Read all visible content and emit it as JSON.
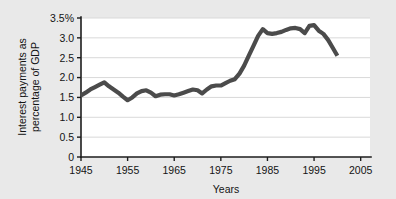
{
  "chart_data": {
    "type": "line",
    "title": "",
    "xlabel": "Years",
    "ylabel": "Interest payments as percentage of GDP",
    "ylabel_line1": "Interest payments as",
    "ylabel_line2": "percentage of GDP",
    "xlim": [
      1945,
      2007
    ],
    "ylim": [
      0,
      3.5
    ],
    "grid": true,
    "legend": "none",
    "line_color": "#4b4b4b",
    "background_color": "#e9e9e9",
    "plot_background_color": "#ffffff",
    "gridline_color": "#d9d9d9",
    "axis_color": "#1d1d1d",
    "ytick_labels": [
      "3.5%",
      "3.0",
      "2.5",
      "2.0",
      "1.5",
      "1.0",
      "0.5",
      "0"
    ],
    "ytick_values": [
      3.5,
      3.0,
      2.5,
      2.0,
      1.5,
      1.0,
      0.5,
      0
    ],
    "xtick_labels": [
      "1945",
      "1955",
      "1965",
      "1975",
      "1985",
      "1995",
      "2005"
    ],
    "xtick_values": [
      1945,
      1955,
      1965,
      1975,
      1985,
      1995,
      2005
    ],
    "x": [
      1945,
      1946,
      1947,
      1948,
      1949,
      1950,
      1951,
      1952,
      1953,
      1954,
      1955,
      1956,
      1957,
      1958,
      1959,
      1960,
      1961,
      1962,
      1963,
      1964,
      1965,
      1966,
      1967,
      1968,
      1969,
      1970,
      1971,
      1972,
      1973,
      1974,
      1975,
      1976,
      1977,
      1978,
      1979,
      1980,
      1981,
      1982,
      1983,
      1984,
      1985,
      1986,
      1987,
      1988,
      1989,
      1990,
      1991,
      1992,
      1993,
      1994,
      1995,
      1996,
      1997,
      1998,
      1999,
      2000
    ],
    "values": [
      1.55,
      1.62,
      1.7,
      1.76,
      1.82,
      1.88,
      1.78,
      1.7,
      1.62,
      1.52,
      1.43,
      1.5,
      1.6,
      1.66,
      1.68,
      1.62,
      1.53,
      1.57,
      1.58,
      1.58,
      1.55,
      1.58,
      1.62,
      1.66,
      1.7,
      1.68,
      1.6,
      1.7,
      1.78,
      1.8,
      1.8,
      1.86,
      1.92,
      1.96,
      2.1,
      2.3,
      2.55,
      2.8,
      3.05,
      3.22,
      3.12,
      3.1,
      3.12,
      3.15,
      3.2,
      3.24,
      3.25,
      3.22,
      3.12,
      3.3,
      3.32,
      3.18,
      3.1,
      2.95,
      2.75,
      2.55
    ],
    "series_name": "Interest payments as percentage of GDP",
    "annotations": []
  },
  "figure": {
    "name": "interest-payments-gdp-line-chart"
  }
}
